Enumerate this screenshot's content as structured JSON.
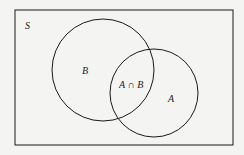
{
  "diagram": {
    "type": "venn",
    "universe_label": "S",
    "sets": [
      {
        "name": "B",
        "label": "B"
      },
      {
        "name": "A",
        "label": "A"
      }
    ],
    "intersection_label": "A ∩ B",
    "colors": {
      "stroke": "#1a1a1a",
      "background": "#f4f4f2"
    }
  }
}
